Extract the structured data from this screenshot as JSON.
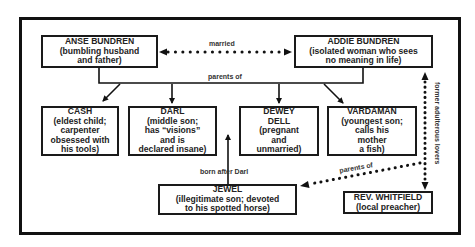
{
  "diagram": {
    "type": "family-relationship-chart",
    "characters": {
      "anse": {
        "name": "ANSE BUNDREN",
        "desc": "(bumbling husband\nand father)"
      },
      "addie": {
        "name": "ADDIE BUNDREN",
        "desc": "(isolated woman who sees\nno meaning in life)"
      },
      "cash": {
        "name": "CASH",
        "desc": "(eldest child;\ncarpenter\nobsessed with\nhis tools)"
      },
      "darl": {
        "name": "DARL",
        "desc": "(middle son;\nhas “visions”\nand is\ndeclared insane)"
      },
      "dewey_dell": {
        "name": "DEWEY\nDELL",
        "desc": "(pregnant\nand\nunmarried)"
      },
      "vardaman": {
        "name": "VARDAMAN",
        "desc": "(youngest son;\ncalls his\nmother\na fish)"
      },
      "jewel": {
        "name": "JEWEL",
        "desc": "(illegitimate son; devoted\nto his spotted horse)"
      },
      "whitfield": {
        "name": "REV. WHITFIELD",
        "desc": "(local preacher)"
      }
    },
    "relations": {
      "married": "married",
      "parents_of": "parents of",
      "born_after_darl": "born after Darl",
      "former_lovers": "former adulterous lovers",
      "parents_of_jewel": "parents of"
    }
  }
}
